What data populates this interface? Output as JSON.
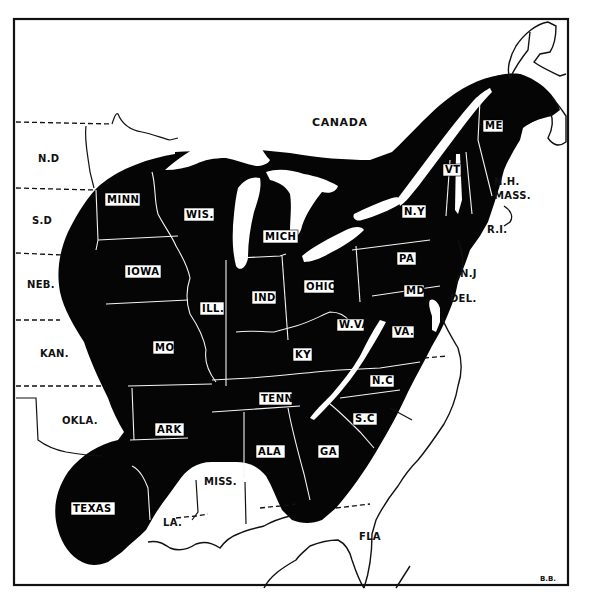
{
  "map": {
    "type": "range-map",
    "colors": {
      "range_fill": "#050505",
      "background": "#ffffff",
      "line": "#111111"
    },
    "regions_outside_range": [
      {
        "id": "canada",
        "label": "CANADA",
        "x": 338,
        "y": 123
      },
      {
        "id": "nd",
        "label": "N.D",
        "x": 48,
        "y": 160
      },
      {
        "id": "sd",
        "label": "S.D",
        "x": 43,
        "y": 222
      },
      {
        "id": "neb",
        "label": "NEB.",
        "x": 41,
        "y": 286
      },
      {
        "id": "kan",
        "label": "KAN.",
        "x": 54,
        "y": 355
      },
      {
        "id": "okla",
        "label": "OKLA.",
        "x": 80,
        "y": 422
      },
      {
        "id": "miss",
        "label": "MISS.",
        "x": 220,
        "y": 483
      },
      {
        "id": "la",
        "label": "LA.",
        "x": 172,
        "y": 524
      },
      {
        "id": "fla",
        "label": "FLA",
        "x": 371,
        "y": 538
      },
      {
        "id": "nh",
        "label": "N.H.",
        "x": 503,
        "y": 183
      },
      {
        "id": "mass",
        "label": "MASS.",
        "x": 507,
        "y": 198
      },
      {
        "id": "ri",
        "label": "R.I.",
        "x": 496,
        "y": 231
      },
      {
        "id": "nj",
        "label": "N.J",
        "x": 468,
        "y": 275
      },
      {
        "id": "del",
        "label": "DEL.",
        "x": 462,
        "y": 300
      }
    ],
    "regions_in_range": [
      {
        "id": "minn",
        "label": "MINN",
        "x": 122,
        "y": 200
      },
      {
        "id": "wis",
        "label": "WIS.",
        "x": 200,
        "y": 214
      },
      {
        "id": "mich",
        "label": "MICH",
        "x": 280,
        "y": 236
      },
      {
        "id": "iowa",
        "label": "IOWA",
        "x": 144,
        "y": 272
      },
      {
        "id": "ill",
        "label": "ILL.",
        "x": 210,
        "y": 308
      },
      {
        "id": "ind",
        "label": "IND",
        "x": 263,
        "y": 297
      },
      {
        "id": "ohio",
        "label": "OHIO",
        "x": 318,
        "y": 286
      },
      {
        "id": "ny",
        "label": "N.Y",
        "x": 413,
        "y": 211
      },
      {
        "id": "pa",
        "label": "PA",
        "x": 406,
        "y": 258
      },
      {
        "id": "md",
        "label": "MD",
        "x": 412,
        "y": 291
      },
      {
        "id": "wva",
        "label": "W.VA",
        "x": 348,
        "y": 325
      },
      {
        "id": "va",
        "label": "VA.",
        "x": 402,
        "y": 332
      },
      {
        "id": "ky",
        "label": "KY",
        "x": 302,
        "y": 354
      },
      {
        "id": "mo",
        "label": "MO",
        "x": 163,
        "y": 347
      },
      {
        "id": "tenn",
        "label": "TENN",
        "x": 274,
        "y": 398
      },
      {
        "id": "nc",
        "label": "N.C",
        "x": 381,
        "y": 381
      },
      {
        "id": "sc",
        "label": "S.C",
        "x": 364,
        "y": 419
      },
      {
        "id": "ark",
        "label": "ARK",
        "x": 169,
        "y": 429
      },
      {
        "id": "ala",
        "label": "ALA",
        "x": 271,
        "y": 451
      },
      {
        "id": "ga",
        "label": "GA",
        "x": 328,
        "y": 451
      },
      {
        "id": "texas",
        "label": "TEXAS",
        "x": 92,
        "y": 508
      },
      {
        "id": "vt",
        "label": "VT",
        "x": 451,
        "y": 170
      },
      {
        "id": "me",
        "label": "ME",
        "x": 492,
        "y": 126
      }
    ],
    "signature": "B.B."
  }
}
